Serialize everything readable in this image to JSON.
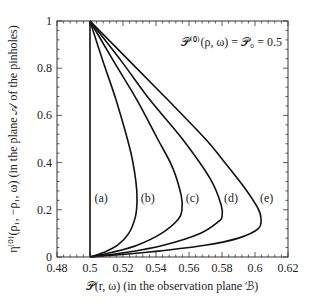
{
  "chart_data": {
    "type": "line",
    "title": "",
    "xlabel": "𝒫(r, ω) (in the observation plane ℬ)",
    "ylabel": "η⁽⁰⁾(ρ₁, −ρ₁, ω) (in the plane 𝒜 of the pinholes)",
    "xlim": [
      0.48,
      0.62
    ],
    "ylim": [
      0,
      1
    ],
    "xticks": [
      0.48,
      0.5,
      0.52,
      0.54,
      0.56,
      0.58,
      0.6,
      0.62
    ],
    "xtick_labels": [
      "0.48",
      "0.5",
      "0.52",
      "0.54",
      "0.56",
      "0.58",
      "0.6",
      "0.62"
    ],
    "yticks": [
      0,
      0.2,
      0.4,
      0.6,
      0.8,
      1
    ],
    "ytick_labels": [
      "0",
      "0.2",
      "0.4",
      "0.6",
      "0.8",
      "1"
    ],
    "x_minor_per_major": 4,
    "y_minor_per_major": 4,
    "grid": false,
    "legend": "none",
    "annotation": "𝒫⁽⁰⁾(ρ, ω) = 𝒫₀ = 0.5",
    "annotation_position": "top-right",
    "series": [
      {
        "name": "(a)",
        "label": "(a)",
        "points": [
          [
            0.5,
            0
          ],
          [
            0.5,
            0.25
          ],
          [
            0.5,
            0.5
          ],
          [
            0.5,
            0.75
          ],
          [
            0.5,
            1
          ]
        ]
      },
      {
        "name": "(b)",
        "label": "(b)",
        "points": [
          [
            0.5,
            0
          ],
          [
            0.5085,
            0.02
          ],
          [
            0.5167,
            0.05
          ],
          [
            0.5235,
            0.1
          ],
          [
            0.5275,
            0.17
          ],
          [
            0.5285,
            0.24
          ],
          [
            0.5278,
            0.32
          ],
          [
            0.5245,
            0.45
          ],
          [
            0.5158,
            0.665
          ],
          [
            0.5078,
            0.83
          ],
          [
            0.5,
            1
          ]
        ]
      },
      {
        "name": "(c)",
        "label": "(c)",
        "points": [
          [
            0.5,
            0
          ],
          [
            0.5135,
            0.02
          ],
          [
            0.5286,
            0.05
          ],
          [
            0.5433,
            0.1
          ],
          [
            0.5535,
            0.16
          ],
          [
            0.5557,
            0.2
          ],
          [
            0.5553,
            0.26
          ],
          [
            0.55,
            0.38
          ],
          [
            0.541,
            0.5
          ],
          [
            0.5285,
            0.665
          ],
          [
            0.5143,
            0.83
          ],
          [
            0.5,
            1
          ]
        ]
      },
      {
        "name": "(d)",
        "label": "(d)",
        "points": [
          [
            0.5,
            0
          ],
          [
            0.5224,
            0.02
          ],
          [
            0.5445,
            0.05
          ],
          [
            0.5667,
            0.1
          ],
          [
            0.5778,
            0.15
          ],
          [
            0.58,
            0.17
          ],
          [
            0.5795,
            0.22
          ],
          [
            0.573,
            0.33
          ],
          [
            0.556,
            0.5
          ],
          [
            0.5364,
            0.665
          ],
          [
            0.519,
            0.83
          ],
          [
            0.5,
            1
          ]
        ]
      },
      {
        "name": "(e)",
        "label": "(e)",
        "points": [
          [
            0.5,
            0
          ],
          [
            0.5342,
            0.02
          ],
          [
            0.5697,
            0.05
          ],
          [
            0.59,
            0.08
          ],
          [
            0.602,
            0.12
          ],
          [
            0.6036,
            0.165
          ],
          [
            0.6015,
            0.21
          ],
          [
            0.593,
            0.3
          ],
          [
            0.5806,
            0.41
          ],
          [
            0.57,
            0.5
          ],
          [
            0.5473,
            0.665
          ],
          [
            0.524,
            0.83
          ],
          [
            0.5,
            1
          ]
        ]
      }
    ],
    "curve_label_y": 0.25,
    "curve_label_x": {
      "(a)": 0.5015,
      "(b)": 0.5295,
      "(c)": 0.5568,
      "(d)": 0.58,
      "(e)": 0.6018
    }
  }
}
